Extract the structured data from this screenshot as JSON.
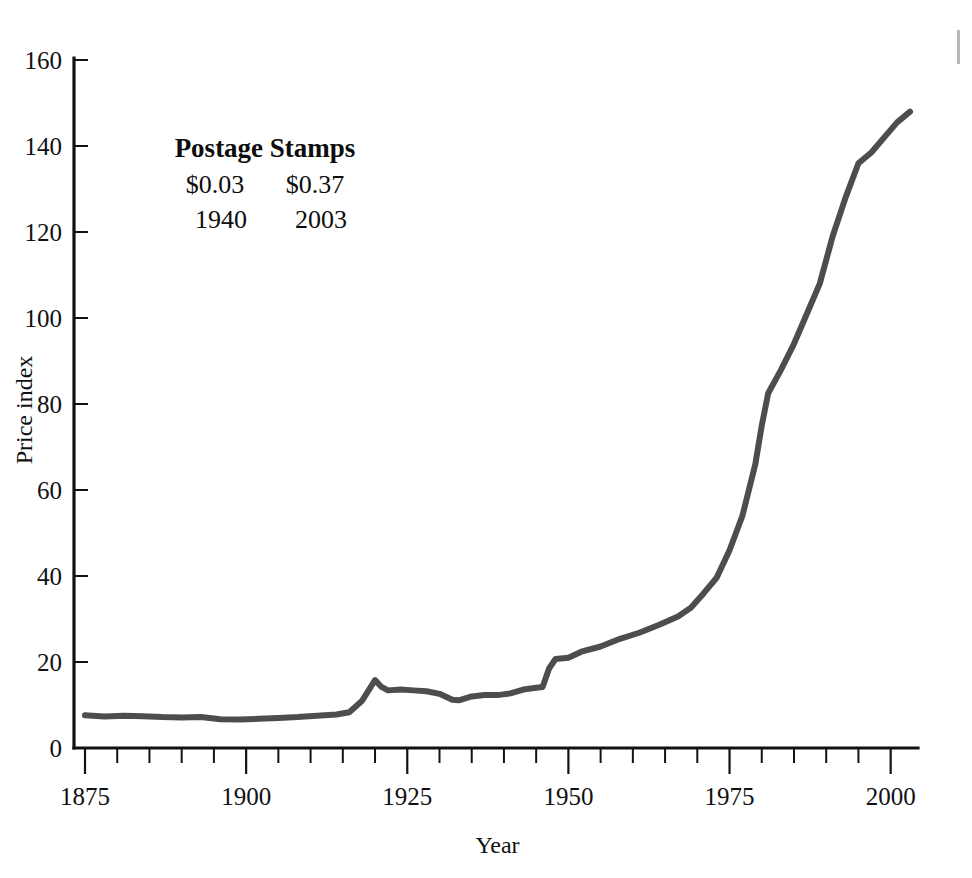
{
  "figure": {
    "background": "#ffffff",
    "line_color": "#4d4d4d",
    "axis_color": "#121212",
    "line_width": 6
  },
  "chart_data": {
    "type": "line",
    "title": "",
    "xlabel": "Year",
    "ylabel": "Price index",
    "xlim": [
      1875,
      2003
    ],
    "ylim": [
      0,
      160
    ],
    "grid": false,
    "legend": "none",
    "x_ticks_major": [
      1875,
      1900,
      1925,
      1950,
      1975,
      2000
    ],
    "x_tick_labels": [
      "1875",
      "1900",
      "1925",
      "1950",
      "1975",
      "2000"
    ],
    "x_tick_minor_step": 5,
    "y_ticks": [
      0,
      20,
      40,
      60,
      80,
      100,
      120,
      140,
      160
    ],
    "y_tick_labels": [
      "0",
      "20",
      "40",
      "60",
      "80",
      "100",
      "120",
      "140",
      "160"
    ],
    "series": [
      {
        "name": "Price index",
        "color": "#4d4d4d",
        "x": [
          1875,
          1878,
          1881,
          1884,
          1887,
          1890,
          1893,
          1896,
          1899,
          1902,
          1905,
          1908,
          1911,
          1914,
          1916,
          1918,
          1920,
          1921,
          1922,
          1924,
          1926,
          1928,
          1930,
          1932,
          1933,
          1935,
          1937,
          1939,
          1941,
          1943,
          1945,
          1946,
          1947,
          1948,
          1950,
          1952,
          1955,
          1958,
          1961,
          1964,
          1967,
          1969,
          1971,
          1973,
          1975,
          1977,
          1979,
          1980,
          1981,
          1983,
          1985,
          1987,
          1989,
          1991,
          1993,
          1995,
          1997,
          1999,
          2001,
          2003
        ],
        "y": [
          7.6,
          7.3,
          7.5,
          7.4,
          7.2,
          7.1,
          7.2,
          6.7,
          6.6,
          6.8,
          7.0,
          7.2,
          7.5,
          7.8,
          8.3,
          11.0,
          15.8,
          14.2,
          13.4,
          13.6,
          13.4,
          13.2,
          12.6,
          11.2,
          11.1,
          12.0,
          12.3,
          12.3,
          12.7,
          13.6,
          14.0,
          14.2,
          18.5,
          20.7,
          21.0,
          22.4,
          23.6,
          25.4,
          26.8,
          28.6,
          30.6,
          32.6,
          36.0,
          39.6,
          46.0,
          54.0,
          66.0,
          75.0,
          82.5,
          88.0,
          94.0,
          101.0,
          108.0,
          119.0,
          128.0,
          136.0,
          138.5,
          142.0,
          145.5,
          148.0
        ]
      }
    ],
    "annotation": {
      "title": "Postage Stamps",
      "columns": [
        {
          "price": "$0.03",
          "year": "1940"
        },
        {
          "price": "$0.37",
          "year": "2003"
        }
      ]
    }
  }
}
